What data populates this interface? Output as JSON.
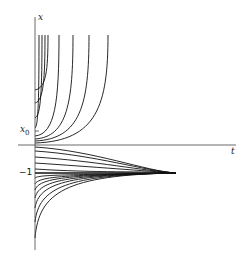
{
  "figure": {
    "type": "solution-curves",
    "axes": {
      "x_label": "t",
      "y_label": "x",
      "origin": [
        35,
        145
      ],
      "x_axis_end": 236,
      "y_axis_top": 17,
      "y_axis_bottom": 250
    },
    "labels": {
      "y_axis": "x",
      "x_axis": "t",
      "x0": "x",
      "x0_sub": "0",
      "minus_one": "−1"
    },
    "equilibrium_level_y": 173,
    "convergence_x": 176,
    "line_color": "#111111",
    "upper_curves_top_x": [
      39,
      42,
      45,
      48,
      59,
      73,
      89,
      108
    ],
    "upper_curves_start_y": [
      128,
      118,
      103,
      90,
      136,
      139,
      141,
      143
    ],
    "lower_curves_start_y": [
      147,
      151,
      157,
      163,
      169,
      178,
      184,
      190,
      198,
      208,
      222,
      238
    ]
  }
}
